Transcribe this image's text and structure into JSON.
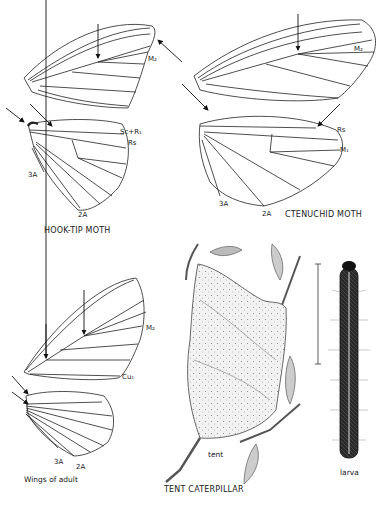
{
  "plate": {
    "figures": [
      {
        "id": "hook-tip-moth",
        "caption": "HOOK-TIP MOTH",
        "vein_labels": [
          "M2",
          "Sc+R1",
          "Rs",
          "3A",
          "2A"
        ]
      },
      {
        "id": "ctenuchid-moth",
        "caption": "CTENUCHID MOTH",
        "vein_labels": [
          "M2",
          "Rs",
          "M1",
          "3A",
          "2A"
        ]
      },
      {
        "id": "tent-caterpillar",
        "caption": "TENT CATERPILLAR",
        "sub_figures": [
          {
            "id": "wings",
            "caption": "Wings of adult",
            "vein_labels": [
              "M2",
              "Cu1",
              "3A",
              "2A"
            ]
          },
          {
            "id": "tent",
            "caption": "tent"
          },
          {
            "id": "larva",
            "caption": "larva"
          }
        ]
      }
    ]
  },
  "labels": {
    "hook_m2": "M₂",
    "hook_scr1": "Sc+R₁",
    "hook_rs": "Rs",
    "hook_3a": "3A",
    "hook_2a": "2A",
    "hook_caption": "HOOK-TIP MOTH",
    "cten_m2": "M₂",
    "cten_rs": "Rs",
    "cten_m1": "M₁",
    "cten_3a": "3A",
    "cten_2a": "2A",
    "cten_caption": "CTENUCHID MOTH",
    "tent_m2": "M₂",
    "tent_cu1": "Cu₁",
    "tent_3a": "3A",
    "tent_2a": "2A",
    "wings_caption": "Wings of adult",
    "tent_label": "tent",
    "larva_label": "larva",
    "tent_caption": "TENT CATERPILLAR"
  }
}
